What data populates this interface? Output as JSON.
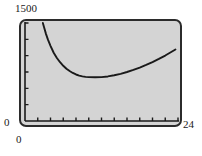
{
  "figure": {
    "name": "graphing-calculator-plot",
    "background_color": "#ffffff",
    "screen_color": "#d4d4d4",
    "frame_color": "#2b2b2b",
    "curve_color": "#1a1a1a"
  },
  "labels": {
    "y_max": "1500",
    "y_zero": "0",
    "x_max": "24",
    "x_zero": "0"
  },
  "chart_data": {
    "type": "line",
    "title": "",
    "xlabel": "",
    "ylabel": "",
    "xlim": [
      0,
      24
    ],
    "ylim": [
      0,
      1500
    ],
    "grid": false,
    "legend": null,
    "x_tick_labels": [
      "0",
      "24"
    ],
    "y_tick_labels": [
      "0",
      "1500"
    ],
    "x_tick_interval": 2,
    "y_tick_interval": 250,
    "x_ticks": [
      0,
      2,
      4,
      6,
      8,
      10,
      12,
      14,
      16,
      18,
      20,
      22,
      24
    ],
    "y_ticks": [
      0,
      250,
      500,
      750,
      1000,
      1250,
      1500
    ],
    "series": [
      {
        "name": "curve",
        "x": [
          2.8,
          3.0,
          3.3,
          3.6,
          4.0,
          4.5,
          5.0,
          5.5,
          6.0,
          6.5,
          7.0,
          7.5,
          8.0,
          8.5,
          9.0,
          9.5,
          10.0,
          11.0,
          12.0,
          13.0,
          14.0,
          15.0,
          16.0,
          17.0,
          18.0,
          19.0,
          20.0,
          21.0,
          22.0,
          23.0,
          23.6
        ],
        "y": [
          1500,
          1430,
          1330,
          1245,
          1150,
          1045,
          965,
          900,
          845,
          800,
          765,
          735,
          712,
          695,
          683,
          676,
          672,
          670,
          672,
          682,
          700,
          722,
          750,
          782,
          818,
          858,
          902,
          950,
          1002,
          1060,
          1095
        ]
      }
    ],
    "annotations": [
      {
        "text": "1500",
        "position": "top-left-outside",
        "axis": "y"
      },
      {
        "text": "0",
        "position": "bottom-left-outside",
        "axis": "y"
      },
      {
        "text": "24",
        "position": "bottom-right-outside",
        "axis": "x"
      },
      {
        "text": "0",
        "position": "below-origin",
        "axis": "x"
      }
    ]
  }
}
